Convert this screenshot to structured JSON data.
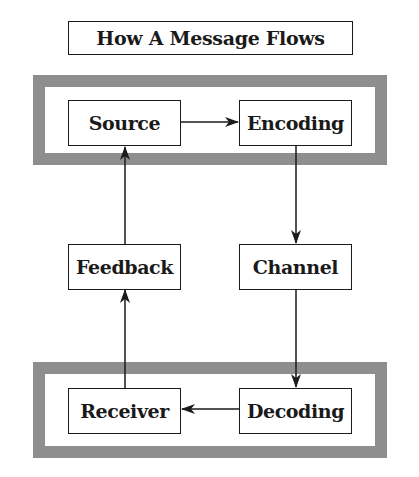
{
  "title": "How A Message Flows",
  "colors": {
    "frame": "#8e8e8e",
    "line": "#1a1a1a",
    "background": "#ffffff"
  },
  "groups": [
    {
      "name": "sender-group",
      "members": [
        "Source",
        "Encoding"
      ]
    },
    {
      "name": "receiver-group",
      "members": [
        "Receiver",
        "Decoding"
      ]
    }
  ],
  "nodes": {
    "source": "Source",
    "encoding": "Encoding",
    "channel": "Channel",
    "decoding": "Decoding",
    "receiver": "Receiver",
    "feedback": "Feedback"
  },
  "edges": [
    {
      "from": "Source",
      "to": "Encoding"
    },
    {
      "from": "Encoding",
      "to": "Channel"
    },
    {
      "from": "Channel",
      "to": "Decoding"
    },
    {
      "from": "Decoding",
      "to": "Receiver"
    },
    {
      "from": "Receiver",
      "to": "Feedback"
    },
    {
      "from": "Feedback",
      "to": "Source"
    }
  ]
}
